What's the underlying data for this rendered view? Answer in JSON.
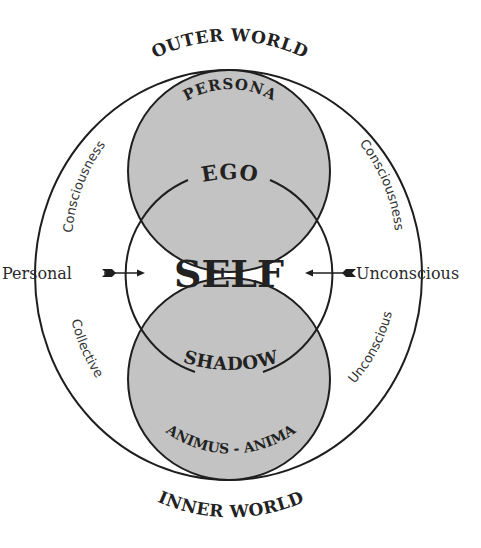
{
  "diagram": {
    "title_top": "OUTER WORLD",
    "title_bottom": "INNER WORLD",
    "center_label": "SELF",
    "upper_circle": {
      "outer_label": "PERSONA",
      "inner_label": "EGO"
    },
    "lower_circle": {
      "inner_label": "SHADOW",
      "outer_label": "ANIMUS - ANIMA"
    },
    "left_side": {
      "label": "Personal",
      "upper_arc_label": "Consciousness",
      "lower_arc_label": "Collective"
    },
    "right_side": {
      "label": "Unconscious",
      "upper_arc_label": "Consciousness",
      "lower_arc_label": "Unconscious"
    },
    "colors": {
      "circle_fill": "#c3c3c3",
      "stroke": "#1e1e1e",
      "background": "#ffffff"
    },
    "icons": {
      "left_arrow": "arrow-right-icon",
      "right_arrow": "arrow-left-icon"
    }
  }
}
